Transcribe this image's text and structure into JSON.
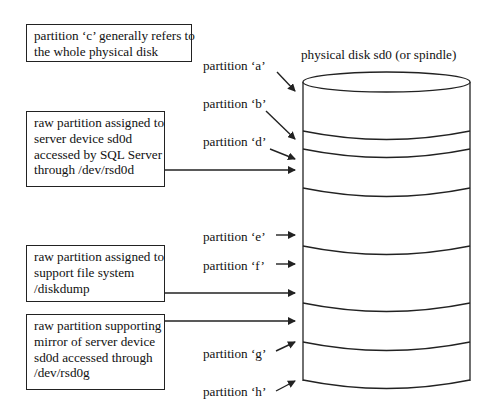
{
  "disk": {
    "title": "physical disk sd0 (or spindle)"
  },
  "notes": [
    {
      "id": "whole-disk",
      "lines": [
        "partition ‘c’ generally refers to",
        "the whole physical disk"
      ]
    },
    {
      "id": "sd0d",
      "lines": [
        "raw partition assigned to",
        "server device sd0d",
        "accessed by SQL Server",
        "through /dev/rsd0d"
      ]
    },
    {
      "id": "diskdump",
      "lines": [
        "raw partition assigned to",
        "support file system",
        "/diskdump"
      ]
    },
    {
      "id": "mirror",
      "lines": [
        "raw partition supporting",
        "mirror of server device",
        "sd0d accessed through",
        "/dev/rsd0g"
      ]
    }
  ],
  "partitions": [
    {
      "label": "partition ‘a’"
    },
    {
      "label": "partition ‘b’"
    },
    {
      "label": "partition ‘d’"
    },
    {
      "label": "partition ‘e’"
    },
    {
      "label": "partition ‘f’"
    },
    {
      "label": "partition ‘g’"
    },
    {
      "label": "partition ‘h’"
    }
  ],
  "colors": {
    "stroke": "#222222",
    "background": "#ffffff"
  }
}
